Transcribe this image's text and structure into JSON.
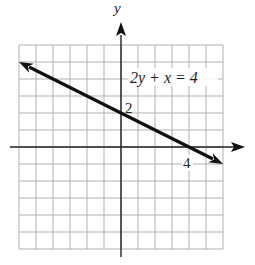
{
  "chart_data": {
    "type": "line",
    "title": "",
    "xlabel": "",
    "ylabel": "y",
    "xlim": [
      -6,
      6
    ],
    "ylim": [
      -6,
      6
    ],
    "grid": true,
    "series": [
      {
        "name": "2y + x = 4",
        "x": [
          -6,
          0,
          4,
          6
        ],
        "y": [
          5,
          2,
          0,
          -1
        ]
      }
    ],
    "annotations": [
      {
        "text": "2y + x = 4",
        "x": 1.5,
        "y": 4
      },
      {
        "text": "2",
        "x": 0.2,
        "y": 2
      },
      {
        "text": "4",
        "x": 4,
        "y": -0.6
      }
    ],
    "tick_labels": {
      "x": [
        "4"
      ],
      "y": [
        "2"
      ]
    }
  },
  "labels": {
    "y_axis": "y",
    "equation": "2y + x = 4",
    "y_intercept": "2",
    "x_intercept": "4"
  }
}
